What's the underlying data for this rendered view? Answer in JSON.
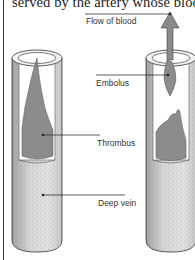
{
  "header": {
    "caption_fragment": "served by the artery whose blood"
  },
  "diagram": {
    "labels": {
      "flow": "Flow of blood",
      "embolus": "Embolus",
      "thrombus": "Thrombus",
      "vein": "Deep vein"
    },
    "colors": {
      "clot": "#8c8c8c",
      "vein_wall": "#d9d9d9",
      "vein_lumen": "#ffffff",
      "arrow": "#8a8a8a",
      "outline": "#333333"
    },
    "panels": [
      {
        "name": "vein-with-thrombus",
        "contains": "Thrombus"
      },
      {
        "name": "vein-with-embolus",
        "contains": "Embolus"
      }
    ]
  }
}
